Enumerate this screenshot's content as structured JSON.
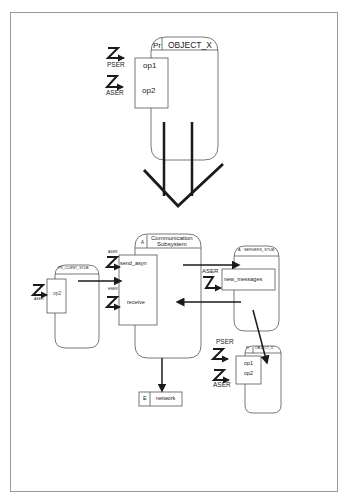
{
  "diagram": {
    "title": "",
    "colors": {
      "line": "#1a1a1a",
      "outline": "#555555",
      "frame": "#9a9a9a"
    },
    "before": {
      "object": {
        "kind": "Pr",
        "name": "OBJECT_X",
        "ops": [
          "op1",
          "op2"
        ]
      },
      "triggers": [
        {
          "glyph": "Z",
          "label": "PSER"
        },
        {
          "glyph": "Z",
          "label": "ASER"
        }
      ]
    },
    "transform_arrow": {
      "direction": "down"
    },
    "after": {
      "client_stub": {
        "kind": "Pr",
        "name": "PR_CLIENT_STUB",
        "ops": [
          "op2"
        ],
        "trigger": {
          "glyph": "Z",
          "label": "ASER"
        }
      },
      "comm_subsystem": {
        "kind": "A",
        "name_line1": "Communication",
        "name_line2": "Subsystem",
        "ops": [
          "send_asyn",
          "receive"
        ],
        "triggers": [
          {
            "glyph": "Z",
            "label": "ASER"
          },
          {
            "glyph": "Z",
            "label": "HSER"
          }
        ]
      },
      "servers_stub": {
        "kind": "A",
        "name": "SERVERS_STUB",
        "ops": [
          "new_messages"
        ],
        "trigger": {
          "glyph": "Z",
          "label": "ASER"
        }
      },
      "object_x": {
        "kind": "Pr",
        "name": "OBJECT_X",
        "ops": [
          "op1",
          "op2"
        ],
        "triggers": [
          {
            "glyph": "Z",
            "label": "PSER"
          },
          {
            "glyph": "Z",
            "label": "ASER"
          }
        ]
      },
      "network": {
        "kind": "E",
        "name": "network"
      }
    }
  }
}
